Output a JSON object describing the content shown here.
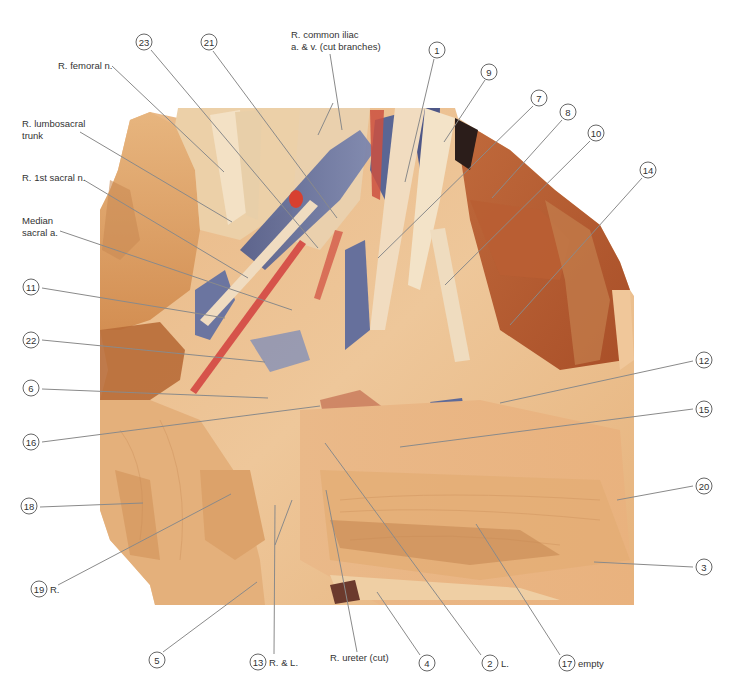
{
  "figure": {
    "colors": {
      "background": "#ffffff",
      "tissue_light": "#efc99a",
      "tissue_mid": "#d99a5e",
      "muscle": "#b4552c",
      "vein": "#5d6a9a",
      "artery": "#d6534a",
      "nerve": "#f2e0c4",
      "leader_line": "#8a8a8a"
    }
  },
  "text_labels": [
    {
      "id": "r-femoral-n",
      "text": "R. femoral n.",
      "x": 58,
      "y": 69
    },
    {
      "id": "r-common-iliac-1",
      "text": "R. common iliac",
      "x": 291,
      "y": 38
    },
    {
      "id": "r-common-iliac-2",
      "text": "a. & v. (cut branches)",
      "x": 291,
      "y": 50
    },
    {
      "id": "r-lumbosacral-1",
      "text": "R. lumbosacral",
      "x": 22,
      "y": 127
    },
    {
      "id": "r-lumbosacral-2",
      "text": "trunk",
      "x": 22,
      "y": 139
    },
    {
      "id": "r-1st-sacral",
      "text": "R. 1st sacral n.",
      "x": 22,
      "y": 181
    },
    {
      "id": "median-sacral-1",
      "text": "Median",
      "x": 22,
      "y": 224
    },
    {
      "id": "median-sacral-2",
      "text": "sacral a.",
      "x": 22,
      "y": 236
    },
    {
      "id": "r-ureter",
      "text": "R. ureter (cut)",
      "x": 330,
      "y": 661
    }
  ],
  "numbered_labels": [
    {
      "num": "23",
      "cx": 144,
      "cy": 42,
      "suffix": ""
    },
    {
      "num": "21",
      "cx": 209,
      "cy": 42,
      "suffix": ""
    },
    {
      "num": "1",
      "cx": 437,
      "cy": 50,
      "suffix": ""
    },
    {
      "num": "9",
      "cx": 489,
      "cy": 72,
      "suffix": ""
    },
    {
      "num": "7",
      "cx": 539,
      "cy": 98,
      "suffix": ""
    },
    {
      "num": "8",
      "cx": 568,
      "cy": 112,
      "suffix": ""
    },
    {
      "num": "10",
      "cx": 596,
      "cy": 133,
      "suffix": ""
    },
    {
      "num": "14",
      "cx": 648,
      "cy": 170,
      "suffix": ""
    },
    {
      "num": "11",
      "cx": 31,
      "cy": 287,
      "suffix": ""
    },
    {
      "num": "22",
      "cx": 31,
      "cy": 340,
      "suffix": ""
    },
    {
      "num": "6",
      "cx": 31,
      "cy": 388,
      "suffix": ""
    },
    {
      "num": "16",
      "cx": 31,
      "cy": 442,
      "suffix": ""
    },
    {
      "num": "12",
      "cx": 704,
      "cy": 360,
      "suffix": ""
    },
    {
      "num": "15",
      "cx": 704,
      "cy": 409,
      "suffix": ""
    },
    {
      "num": "20",
      "cx": 704,
      "cy": 486,
      "suffix": ""
    },
    {
      "num": "3",
      "cx": 704,
      "cy": 567,
      "suffix": ""
    },
    {
      "num": "18",
      "cx": 29,
      "cy": 506,
      "suffix": ""
    },
    {
      "num": "19",
      "cx": 39,
      "cy": 589,
      "suffix": "R."
    },
    {
      "num": "5",
      "cx": 157,
      "cy": 660,
      "suffix": ""
    },
    {
      "num": "13",
      "cx": 258,
      "cy": 662,
      "suffix": "R. & L."
    },
    {
      "num": "4",
      "cx": 427,
      "cy": 663,
      "suffix": ""
    },
    {
      "num": "2",
      "cx": 490,
      "cy": 663,
      "suffix": "L."
    },
    {
      "num": "17",
      "cx": 567,
      "cy": 663,
      "suffix": "empty"
    }
  ],
  "leader_lines": [
    {
      "for": "r-femoral-n",
      "x1": 112,
      "y1": 66,
      "x2": 224,
      "y2": 172
    },
    {
      "for": "23",
      "x1": 151,
      "y1": 50,
      "x2": 318,
      "y2": 248
    },
    {
      "for": "21",
      "x1": 213,
      "y1": 51,
      "x2": 337,
      "y2": 218
    },
    {
      "for": "r-common-iliac-a",
      "x1": 330,
      "y1": 54,
      "x2": 342,
      "y2": 130
    },
    {
      "for": "r-common-iliac-b",
      "x1": 333,
      "y1": 103,
      "x2": 318,
      "y2": 135
    },
    {
      "for": "r-lumbosacral",
      "x1": 80,
      "y1": 132,
      "x2": 232,
      "y2": 222
    },
    {
      "for": "r-1st-sacral",
      "x1": 84,
      "y1": 180,
      "x2": 248,
      "y2": 278
    },
    {
      "for": "median-sacral",
      "x1": 60,
      "y1": 231,
      "x2": 292,
      "y2": 310
    },
    {
      "for": "1",
      "x1": 434,
      "y1": 59,
      "x2": 405,
      "y2": 182
    },
    {
      "for": "9",
      "x1": 485,
      "y1": 80,
      "x2": 444,
      "y2": 142
    },
    {
      "for": "7",
      "x1": 533,
      "y1": 106,
      "x2": 378,
      "y2": 258
    },
    {
      "for": "8",
      "x1": 562,
      "y1": 120,
      "x2": 492,
      "y2": 198
    },
    {
      "for": "10",
      "x1": 590,
      "y1": 141,
      "x2": 445,
      "y2": 285
    },
    {
      "for": "14",
      "x1": 642,
      "y1": 178,
      "x2": 510,
      "y2": 325
    },
    {
      "for": "11",
      "x1": 42,
      "y1": 288,
      "x2": 225,
      "y2": 318
    },
    {
      "for": "22",
      "x1": 42,
      "y1": 340,
      "x2": 265,
      "y2": 362
    },
    {
      "for": "6",
      "x1": 42,
      "y1": 389,
      "x2": 268,
      "y2": 398
    },
    {
      "for": "16",
      "x1": 42,
      "y1": 442,
      "x2": 320,
      "y2": 406
    },
    {
      "for": "12",
      "x1": 693,
      "y1": 361,
      "x2": 500,
      "y2": 403
    },
    {
      "for": "15",
      "x1": 693,
      "y1": 409,
      "x2": 400,
      "y2": 447
    },
    {
      "for": "20",
      "x1": 693,
      "y1": 486,
      "x2": 617,
      "y2": 500
    },
    {
      "for": "3",
      "x1": 693,
      "y1": 567,
      "x2": 594,
      "y2": 562
    },
    {
      "for": "18",
      "x1": 40,
      "y1": 507,
      "x2": 143,
      "y2": 503
    },
    {
      "for": "19",
      "x1": 58,
      "y1": 585,
      "x2": 231,
      "y2": 494
    },
    {
      "for": "5",
      "x1": 163,
      "y1": 652,
      "x2": 257,
      "y2": 582
    },
    {
      "for": "13a",
      "x1": 274,
      "y1": 654,
      "x2": 275,
      "y2": 505
    },
    {
      "for": "13b",
      "x1": 275,
      "y1": 545,
      "x2": 292,
      "y2": 500
    },
    {
      "for": "r-ureter",
      "x1": 357,
      "y1": 652,
      "x2": 326,
      "y2": 490
    },
    {
      "for": "4",
      "x1": 420,
      "y1": 655,
      "x2": 377,
      "y2": 592
    },
    {
      "for": "2",
      "x1": 481,
      "y1": 655,
      "x2": 325,
      "y2": 443
    },
    {
      "for": "17",
      "x1": 560,
      "y1": 655,
      "x2": 476,
      "y2": 524
    }
  ]
}
